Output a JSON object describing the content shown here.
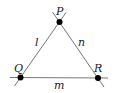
{
  "diagram": {
    "vertices": [
      {
        "label": "P",
        "x": 59.5,
        "y": 22
      },
      {
        "label": "Q",
        "x": 20.5,
        "y": 77.5
      },
      {
        "label": "R",
        "x": 98,
        "y": 78
      }
    ],
    "edges": [
      {
        "label": "l",
        "from": "Q",
        "to": "P"
      },
      {
        "label": "m",
        "from": "Q",
        "to": "R"
      },
      {
        "label": "n",
        "from": "P",
        "to": "R"
      }
    ],
    "colors": {
      "line": "#777777",
      "point": "#000000",
      "text": "#222222"
    }
  }
}
